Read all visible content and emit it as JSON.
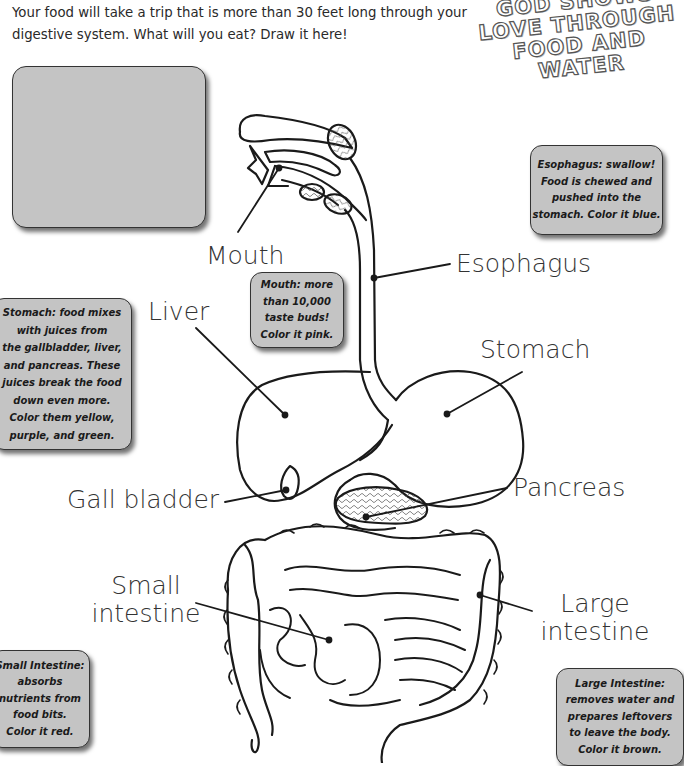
{
  "intro": {
    "line1": "Your food will take a trip that is more than 30 feet long through your",
    "line2": "digestive system. What will you eat? Draw it here!"
  },
  "title_art": {
    "lines": [
      "GOD SHOWS",
      "LOVE THROUGH",
      "FOOD AND",
      "WATER"
    ]
  },
  "draw_box": {
    "content": ""
  },
  "notes": {
    "esophagus": [
      "Esophagus: swallow!",
      "Food is chewed and",
      "pushed into the",
      "stomach. Color it blue."
    ],
    "stomach": [
      "Stomach: food mixes",
      "with juices from",
      "the gallbladder, liver,",
      "and pancreas. These",
      "juices break the food",
      "down even more.",
      "Color them yellow,",
      "purple, and green."
    ],
    "mouth": [
      "Mouth: more",
      "than 10,000",
      "taste buds!",
      "Color it pink."
    ],
    "small_intestine": [
      "Small Intestine:",
      "absorbs",
      "nutrients from",
      "food bits.",
      "Color it red."
    ],
    "large_intestine": [
      "Large Intestine:",
      "removes water and",
      "prepares leftovers",
      "to leave the body.",
      "Color it brown."
    ]
  },
  "labels": {
    "mouth": "Mouth",
    "esophagus": "Esophagus",
    "liver": "Liver",
    "stomach": "Stomach",
    "gall_bladder": "Gall bladder",
    "pancreas": "Pancreas",
    "small_intestine": [
      "Small",
      "intestine"
    ],
    "large_intestine": [
      "Large",
      "intestine"
    ]
  },
  "colors": {
    "note_bg": "#c4c4c4",
    "note_border": "#333333",
    "line": "#1a1a1a",
    "label_text": "#333333"
  }
}
